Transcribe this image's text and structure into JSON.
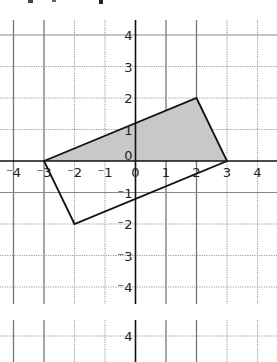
{
  "figure": {
    "graph1": {
      "x_range": [
        -4,
        4
      ],
      "y_range": [
        -4,
        4
      ],
      "x_tick_labels": [
        "-4",
        "-3",
        "-2",
        "-1",
        "0",
        "1",
        "2",
        "3",
        "4"
      ],
      "y_tick_labels": [
        "4",
        "3",
        "2",
        "1",
        "0",
        "-1",
        "-2",
        "-3",
        "-4"
      ],
      "quadrilateral_vertices": [
        [
          -3,
          0
        ],
        [
          2,
          2
        ],
        [
          3,
          0
        ],
        [
          -2,
          -2
        ]
      ],
      "shaded_triangle_vertices": [
        [
          -3,
          0
        ],
        [
          2,
          2
        ],
        [
          3,
          0
        ]
      ],
      "shade_color": "#c8c8c8",
      "line_color": "#111111"
    },
    "graph2": {
      "visible_y_tick_labels": [
        "4"
      ]
    }
  }
}
